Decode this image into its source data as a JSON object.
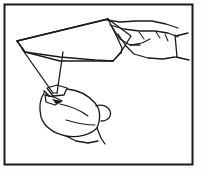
{
  "figure": {
    "style": "black and white line art",
    "caption": ""
  },
  "colors": {
    "ink": "#1a1a1a",
    "paper": "#ffffff",
    "background": "#fdfdfd",
    "frame": "#1a1a1a"
  },
  "frame": {
    "name": "illustration-border",
    "x": 4.5,
    "y": 4.5,
    "width": 188,
    "height": 160,
    "stroke_width": 2
  },
  "shapes": {
    "paper_sheet": {
      "label": "folded paper sheet",
      "outline": "M17,41 L108,19 L131,36 L121,52 L113,61 L60,61 L25,52 Z"
    },
    "paper_top_edge": {
      "label": "top edge of paper",
      "path": "M17,41 L108,19"
    },
    "paper_left_vertex": {
      "label": "left point of paper",
      "x": 17,
      "y": 41
    },
    "paper_bottom_edge": {
      "label": "lower edge of paper",
      "path": "M25,52 L113,61"
    },
    "paper_fold_crease": {
      "label": "diagonal crease line",
      "path": "M108,19 L122,52"
    },
    "hanging_flap": {
      "label": "triangular flap hanging down",
      "path": "M22,49 L53,94 L63,51"
    },
    "flap_inner_line": {
      "label": "inner edge of hanging flap",
      "path": "M63,51 L56,93"
    },
    "right_hand": {
      "label": "right hand gripping the paper",
      "knuckle_line": "M108,19 L126,23 L150,22 L170,26 L184,32",
      "palm_edge": "M117,31 L140,40 L156,46 L170,48 L183,46",
      "thumb": "M114,28 L122,40 L131,44 L140,42",
      "wrist_top": "M175,27 L186,31",
      "wrist_bottom": "M172,50 L186,55",
      "cuff": "M176,29 L178,53",
      "finger_crease_1": "M131,35 L137,39",
      "finger_crease_2": "M146,38 L152,43",
      "lower_contour": "M122,52 L136,57 L152,58 L168,56"
    },
    "left_hand": {
      "label": "left hand pinching the flap point",
      "index_finger": "M48,88 L58,86 L66,89 L62,95 L52,96 Z",
      "thumb_tip": "M44,95 L52,97 L60,101 L54,104 L46,101 Z",
      "pinch_point": "M44,92 L50,95",
      "fist_outline": "M43,93 L40,104 L41,117 L50,128 L66,134 L84,133 L96,127 L101,118 L99,107 L92,99 L80,93 L68,90",
      "knuckle_1": "M62,103 L76,106 L88,112",
      "knuckle_2": "M70,119 L84,122 L95,124",
      "pinky_edge": "M99,110 L107,108 L112,113 L108,120 L100,121",
      "wrist_lower": "M84,133 L92,139 L99,143",
      "wrist_line": "M97,124 L104,131 L104,140"
    }
  },
  "annotations": {
    "count": 0,
    "items": []
  }
}
